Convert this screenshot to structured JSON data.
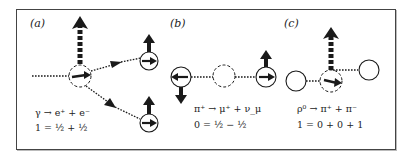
{
  "panels": [
    {
      "id": "a",
      "label": "(a)",
      "reaction": {
        "lhs": "γ",
        "arrow": "→",
        "rhs": [
          "e⁺",
          "e⁻"
        ]
      },
      "reaction_text": "γ → e⁺ + e⁻",
      "spin_equation": "1 = ½ + ½"
    },
    {
      "id": "b",
      "label": "(b)",
      "reaction": {
        "lhs": "π⁺",
        "arrow": "→",
        "rhs": [
          "μ⁺",
          "ν_μ"
        ]
      },
      "reaction_text": "π⁺ → μ⁺ + ν_μ",
      "spin_equation": "0 = ½ − ½"
    },
    {
      "id": "c",
      "label": "(c)",
      "reaction": {
        "lhs": "ρ⁰",
        "arrow": "→",
        "rhs": [
          "π⁺",
          "π⁻"
        ]
      },
      "reaction_text": "ρ⁰ → π⁺ + π⁻",
      "spin_equation": "1 = 0 + 0 + 1"
    }
  ],
  "colors": {
    "ink": "#1a1a1a",
    "frame": "#444444",
    "background": "#ffffff"
  }
}
